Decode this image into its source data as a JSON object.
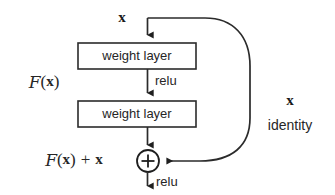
{
  "diagram": {
    "background_color": "#ffffff",
    "stroke_color": "#2b2b2b",
    "text_color": "#262626",
    "input_label": "x",
    "blocks": [
      {
        "id": "weight-layer-1",
        "label": "weight layer"
      },
      {
        "id": "weight-layer-2",
        "label": "weight layer"
      }
    ],
    "activations": [
      {
        "id": "relu-mid",
        "label": "relu"
      },
      {
        "id": "relu-out",
        "label": "relu"
      }
    ],
    "residual_function_label": "F(x)",
    "residual_function_parts": {
      "script": "F",
      "open": "(",
      "var": "x",
      "close": ")"
    },
    "output_label": "F(x) + x",
    "output_label_parts": {
      "script": "F",
      "open": "(",
      "var": "x",
      "close": ")",
      "plus": "+",
      "var2": "x"
    },
    "shortcut": {
      "var_label": "x",
      "name_label": "identity"
    },
    "operator": {
      "id": "add-operator",
      "symbol": "+",
      "name": "element-wise-addition"
    }
  },
  "geometry": {
    "center_x": 147.5,
    "box_left": 78,
    "box_right": 196,
    "box1_top": 43,
    "box1_bottom": 69,
    "box2_top": 101,
    "box2_bottom": 127,
    "branch_y": 18,
    "adder_cx": 148,
    "adder_cy": 161,
    "adder_r": 11
  }
}
